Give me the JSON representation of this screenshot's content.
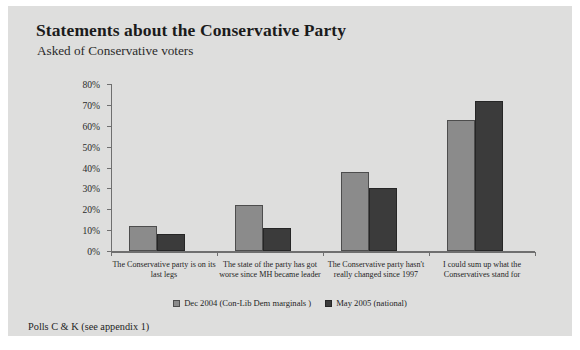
{
  "slide": {
    "title": "Statements about the Conservative Party",
    "subtitle": "Asked of Conservative voters",
    "footnote": "Polls C & K (see appendix 1)"
  },
  "colors": {
    "panel_background": "#dededd",
    "series_1": "#8b8b8b",
    "series_2": "#3b3b3b",
    "axis": "#6f6f6f",
    "text": "#1f1f1f"
  },
  "chart_data": {
    "type": "bar",
    "title": "Statements about the Conservative Party",
    "subtitle": "Asked of Conservative voters",
    "xlabel": "",
    "ylabel": "",
    "ylim": [
      0,
      80
    ],
    "ytick_values": [
      0,
      10,
      20,
      30,
      40,
      50,
      60,
      70,
      80
    ],
    "ytick_labels": [
      "0%",
      "10%",
      "20%",
      "30%",
      "40%",
      "50%",
      "60%",
      "70%",
      "80%"
    ],
    "grid": false,
    "legend_position": "bottom",
    "categories": [
      "The Conservative party is on its last legs",
      "The state of the party has got worse since MH became leader",
      "The Conservative party hasn't really changed since 1997",
      "I could sum up what the Conservatives stand for"
    ],
    "series": [
      {
        "name": "Dec 2004 (Con-Lib Dem marginals )",
        "values": [
          12,
          22,
          38,
          63
        ]
      },
      {
        "name": "May 2005 (national)",
        "values": [
          8,
          11,
          30,
          72
        ]
      }
    ]
  }
}
